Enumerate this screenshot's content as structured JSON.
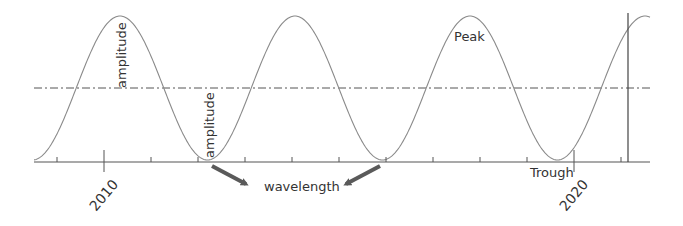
{
  "chart_data": {
    "type": "line",
    "title": "",
    "xlabel": "",
    "ylabel": "",
    "x_tick_labels": [
      "2010",
      "2020"
    ],
    "x_range": [
      2008.6,
      2021
    ],
    "wave": {
      "period_years": 3.7,
      "peaks_x_approx": [
        2010.3,
        2014.0,
        2017.7,
        2021.4
      ],
      "troughs_x_approx": [
        2008.4,
        2012.1,
        2015.9,
        2019.6
      ],
      "midline": 0,
      "amplitude": 1
    },
    "grid": false,
    "legend": null
  },
  "labels": {
    "amplitude_top": "amplitude",
    "amplitude_bottom": "amplitude",
    "peak": "Peak",
    "trough": "Trough",
    "wavelength": "wavelength",
    "year_2010": "2010",
    "year_2020": "2020"
  },
  "colors": {
    "wave": "#8a8a8a",
    "axis": "#555555",
    "midline": "#555555",
    "arrow": "#5a5a5a",
    "text": "#333333"
  }
}
